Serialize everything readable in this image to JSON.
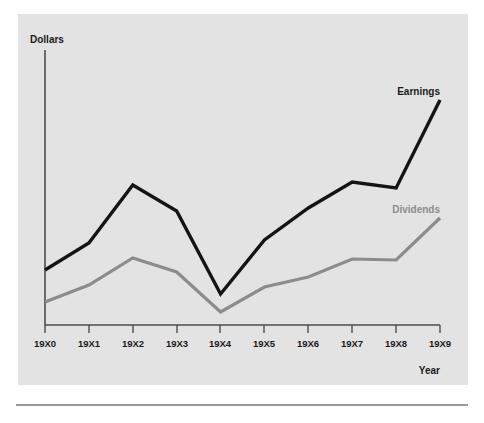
{
  "chart_data": {
    "type": "line",
    "title": "",
    "xlabel": "Year",
    "ylabel": "Dollars",
    "categories": [
      "19X0",
      "19X1",
      "19X2",
      "19X3",
      "19X4",
      "19X5",
      "19X6",
      "19X7",
      "19X8",
      "19X9"
    ],
    "series": [
      {
        "name": "Earnings",
        "color": "#141414",
        "values": [
          0.55,
          0.82,
          1.4,
          1.14,
          0.31,
          0.85,
          1.17,
          1.43,
          1.37,
          2.25
        ]
      },
      {
        "name": "Dividends",
        "color": "#8c8c8c",
        "values": [
          0.23,
          0.4,
          0.67,
          0.53,
          0.13,
          0.38,
          0.48,
          0.66,
          0.65,
          1.07
        ]
      }
    ],
    "ylim": [
      0,
      2.4
    ],
    "xlim": [
      "19X0",
      "19X9"
    ],
    "grid": false,
    "legend_position": "inline-end-of-line",
    "annotations": [
      {
        "text": "Earnings",
        "series": "Earnings"
      },
      {
        "text": "Dividends",
        "series": "Dividends"
      }
    ]
  },
  "axes": {
    "y_axis_title": "Dollars",
    "x_axis_title": "Year",
    "x_tick_labels": [
      "19X0",
      "19X1",
      "19X2",
      "19X3",
      "19X4",
      "19X5",
      "19X6",
      "19X7",
      "19X8",
      "19X9"
    ],
    "y_tick_labels": []
  },
  "labels": {
    "earnings": "Earnings",
    "dividends": "Dividends"
  },
  "colors": {
    "panel_background": "#e3e3e3",
    "page_background": "#ffffff",
    "earnings_line": "#141414",
    "dividends_line": "#8c8c8c",
    "axis_line": "#4d4d4d",
    "rule": "#9a9a9a",
    "text": "#1a1a1a"
  }
}
